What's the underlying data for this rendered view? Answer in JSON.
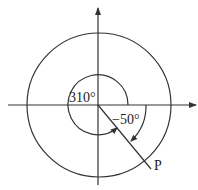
{
  "diagram": {
    "type": "angle-diagram",
    "labels": {
      "positive_angle": "310°",
      "negative_angle": "−50°",
      "point": "P"
    },
    "angles_deg": {
      "positive": 310,
      "negative": -50
    },
    "colors": {
      "stroke": "#333333",
      "background": "#ffffff"
    }
  }
}
